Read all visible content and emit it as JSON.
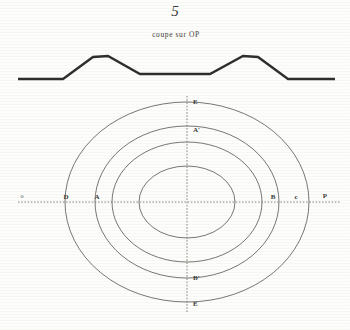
{
  "plate": {
    "figure_number": "5",
    "caption": "coupe sur OP"
  },
  "cross_section": {
    "name": "terrain-profile",
    "description": "symmetric two-ridge terrain cross section along line OP",
    "baseline_y": 79,
    "points": [
      [
        18,
        79
      ],
      [
        63,
        79
      ],
      [
        93,
        57
      ],
      [
        108,
        56
      ],
      [
        140,
        74
      ],
      [
        210,
        74
      ],
      [
        243,
        56
      ],
      [
        258,
        57
      ],
      [
        288,
        79
      ],
      [
        335,
        79
      ]
    ]
  },
  "plan": {
    "center": [
      187,
      202
    ],
    "ellipses": [
      {
        "name": "outer-ellipse",
        "rx": 122,
        "ry": 100
      },
      {
        "name": "second-ellipse",
        "rx": 92,
        "ry": 76
      },
      {
        "name": "third-ellipse",
        "rx": 75,
        "ry": 60
      },
      {
        "name": "inner-ellipse",
        "rx": 48,
        "ry": 36
      }
    ],
    "horizontal_axis": {
      "x1": 18,
      "x2": 340,
      "y": 202
    },
    "vertical_axis": {
      "x": 187,
      "y1": 96,
      "y2": 312
    }
  },
  "labels": {
    "origin": "o",
    "left_outer": "D",
    "left_inner": "A",
    "right_inner": "B",
    "right_outer": "c",
    "terminus": "P",
    "top_outer": "E",
    "top_inner": "A'",
    "bottom_inner": "B'",
    "bottom_outer": "E"
  },
  "colors": {
    "paper": "#fdfdfb",
    "ink": "#3a3a38",
    "line": "#4a4a46",
    "profile": "#2e2e2c"
  }
}
